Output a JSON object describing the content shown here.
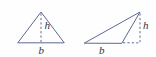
{
  "figure": {
    "background_color": "#fefefe",
    "line_color": "#5b6a92",
    "label_color": "#2e3340",
    "diagrams": [
      {
        "name": "acute-triangle",
        "description": "Acute triangle with interior altitude",
        "labels": {
          "height": "h",
          "base": "b"
        }
      },
      {
        "name": "obtuse-triangle",
        "description": "Obtuse triangle with exterior altitude to extended base",
        "labels": {
          "height": "h",
          "base": "b"
        }
      }
    ]
  }
}
